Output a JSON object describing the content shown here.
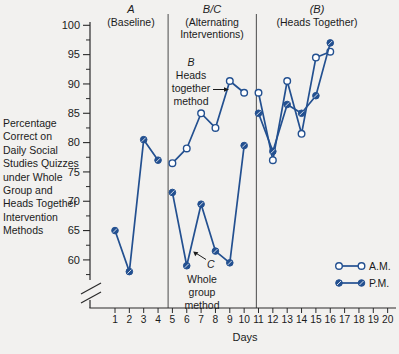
{
  "figure": {
    "y_axis_title_lines": [
      "Percentage",
      "Correct on",
      "Daily Social",
      "Studies Quizzes",
      "under Whole",
      "Group and",
      "Heads Together",
      "Intervention",
      "Methods"
    ],
    "x_axis_label": "Days",
    "colors": {
      "series_line": "#235090",
      "text": "#1b1b1b",
      "axis": "#2a2a2a",
      "divider": "#4a4a4a",
      "background": "#f2f1ef",
      "open_marker_fill": "#ffffff"
    }
  },
  "phase_headers": [
    {
      "letter": "A",
      "subtitle_lines": [
        "(Baseline)"
      ]
    },
    {
      "letter": "B/C",
      "subtitle_lines": [
        "(Alternating",
        "Interventions)"
      ]
    },
    {
      "letter": "(B)",
      "subtitle_lines": [
        "(Heads Together)"
      ]
    }
  ],
  "annotations": {
    "b": {
      "letter": "B",
      "lines": [
        "Heads",
        "together",
        "method"
      ]
    },
    "c": {
      "letter": "C",
      "lines": [
        "Whole",
        "group",
        "method"
      ]
    }
  },
  "legend": {
    "items": [
      {
        "label": "A.M.",
        "marker": "open"
      },
      {
        "label": "P.M.",
        "marker": "filled"
      }
    ]
  },
  "chart_data": {
    "type": "line",
    "xlabel": "Days",
    "ylabel": "Percentage correct",
    "x_ticks": [
      1,
      2,
      3,
      4,
      5,
      6,
      7,
      8,
      9,
      10,
      11,
      12,
      13,
      14,
      15,
      16,
      17,
      18,
      19,
      20
    ],
    "y_major_ticks": [
      60,
      65,
      70,
      75,
      80,
      85,
      90,
      95,
      100
    ],
    "y_minor_ticks": [
      57.5,
      62.5,
      67.5,
      72.5,
      77.5,
      82.5,
      87.5,
      92.5,
      97.5
    ],
    "ylim": [
      57.5,
      100
    ],
    "y_axis_break": true,
    "grid": false,
    "legend_position": "lower right",
    "phases": [
      {
        "label": "A (Baseline)",
        "day_range": [
          1,
          4
        ],
        "divider_after_day": 4.7
      },
      {
        "label": "B/C (Alternating Interventions)",
        "day_range": [
          5,
          10
        ],
        "divider_after_day": 10.85
      },
      {
        "label": "(B) (Heads Together)",
        "day_range": [
          11,
          16
        ],
        "divider_after_day": null
      }
    ],
    "series": [
      {
        "name": "A.M.",
        "marker": "open",
        "segments": [
          {
            "phase": "B/C",
            "days": [
              5,
              6,
              7,
              8,
              9,
              10
            ],
            "values": [
              76.5,
              79,
              85,
              82.5,
              90.5,
              88.5
            ]
          },
          {
            "phase": "(B)",
            "days": [
              11,
              12,
              13,
              14,
              15,
              16
            ],
            "values": [
              88.5,
              77,
              90.5,
              81.5,
              94.5,
              95.5
            ]
          }
        ]
      },
      {
        "name": "P.M.",
        "marker": "filled",
        "segments": [
          {
            "phase": "A",
            "days": [
              1,
              2,
              3,
              4
            ],
            "values": [
              65,
              58,
              80.5,
              77
            ]
          },
          {
            "phase": "B/C",
            "days": [
              5,
              6,
              7,
              8,
              9,
              10
            ],
            "values": [
              71.5,
              59,
              69.5,
              61.5,
              59.5,
              79.5
            ]
          },
          {
            "phase": "(B)",
            "days": [
              11,
              12,
              13,
              14,
              15,
              16
            ],
            "values": [
              85,
              78.5,
              86.5,
              85,
              88,
              97
            ]
          }
        ]
      }
    ]
  }
}
